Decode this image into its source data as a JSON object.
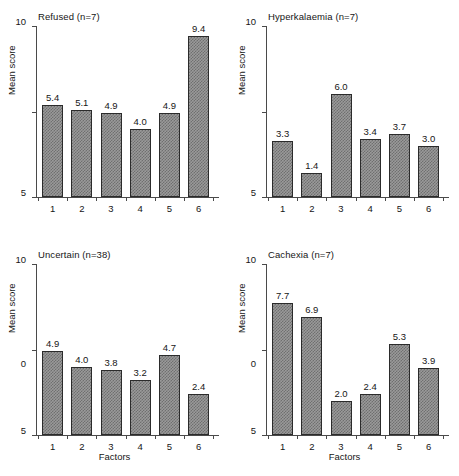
{
  "figure": {
    "width": 459,
    "height": 476,
    "background": "#ffffff",
    "bar_fill_color": "#9a9a9a",
    "bar_edge_color": "#2b2b2b",
    "axis_color": "#4a4a4a",
    "text_color": "#161616"
  },
  "shared": {
    "ylabel": "Mean score",
    "xlabel": "Factors",
    "ytick_labels": [
      "0",
      "5",
      "10"
    ],
    "ytick_values": [
      0,
      5,
      10
    ],
    "xtick_labels": [
      "1",
      "2",
      "3",
      "4",
      "5",
      "6"
    ]
  },
  "chart_data": [
    {
      "type": "bar",
      "panel": "top-left",
      "title": "Refused (n=7)",
      "categories": [
        "1",
        "2",
        "3",
        "4",
        "5",
        "6"
      ],
      "values": [
        5.4,
        5.1,
        4.9,
        4.0,
        4.9,
        9.4
      ],
      "value_labels": [
        "5.4",
        "5.1",
        "4.9",
        "4.0",
        "4.9",
        "9.4"
      ],
      "xlabel": "",
      "ylabel": "Mean score",
      "ylim": [
        0,
        10
      ],
      "yticks": [
        0,
        5,
        10
      ],
      "grid": false,
      "legend": false
    },
    {
      "type": "bar",
      "panel": "top-right",
      "title": "Hyperkalaemia (n=7)",
      "categories": [
        "1",
        "2",
        "3",
        "4",
        "5",
        "6"
      ],
      "values": [
        3.3,
        1.4,
        6.0,
        3.4,
        3.7,
        3.0
      ],
      "value_labels": [
        "3.3",
        "1.4",
        "6.0",
        "3.4",
        "3.7",
        "3.0"
      ],
      "xlabel": "",
      "ylabel": "Mean score",
      "ylim": [
        0,
        10
      ],
      "yticks": [
        0,
        5,
        10
      ],
      "grid": false,
      "legend": false
    },
    {
      "type": "bar",
      "panel": "bottom-left",
      "title": "Uncertain (n=38)",
      "categories": [
        "1",
        "2",
        "3",
        "4",
        "5",
        "6"
      ],
      "values": [
        4.9,
        4.0,
        3.8,
        3.2,
        4.7,
        2.4
      ],
      "value_labels": [
        "4.9",
        "4.0",
        "3.8",
        "3.2",
        "4.7",
        "2.4"
      ],
      "xlabel": "Factors",
      "ylabel": "Mean score",
      "ylim": [
        0,
        10
      ],
      "yticks": [
        0,
        5,
        10
      ],
      "grid": false,
      "legend": false
    },
    {
      "type": "bar",
      "panel": "bottom-right",
      "title": "Cachexia (n=7)",
      "categories": [
        "1",
        "2",
        "3",
        "4",
        "5",
        "6"
      ],
      "values": [
        7.7,
        6.9,
        2.0,
        2.4,
        5.3,
        3.9
      ],
      "value_labels": [
        "7.7",
        "6.9",
        "2.0",
        "2.4",
        "5.3",
        "3.9"
      ],
      "xlabel": "Factors",
      "ylabel": "Mean score",
      "ylim": [
        0,
        10
      ],
      "yticks": [
        0,
        5,
        10
      ],
      "grid": false,
      "legend": false
    }
  ]
}
